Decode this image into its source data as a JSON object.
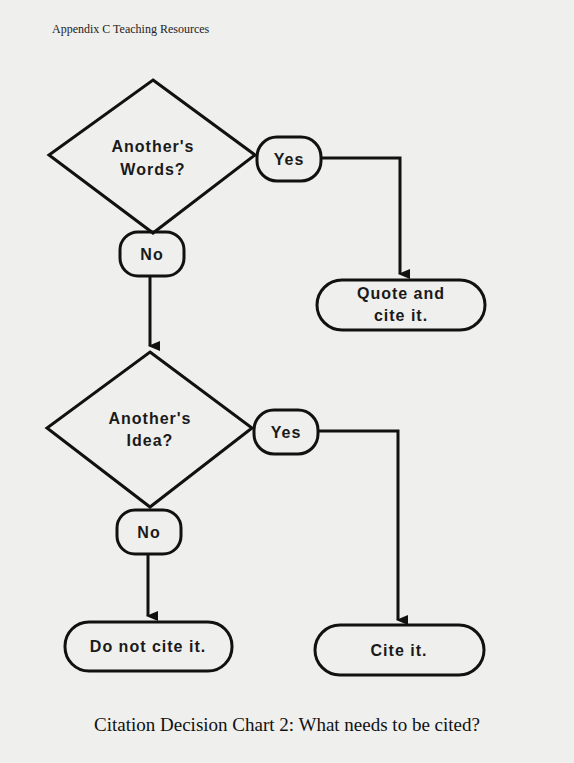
{
  "header": "Appendix C  Teaching Resources",
  "caption": "Citation Decision Chart 2: What needs to be cited?",
  "decisions": [
    {
      "line1": "Another's",
      "line2": "Words?"
    },
    {
      "line1": "Another's",
      "line2": "Idea?"
    }
  ],
  "branches": {
    "yes1": "Yes",
    "no1": "No",
    "yes2": "Yes",
    "no2": "No"
  },
  "outcomes": {
    "quote": {
      "line1": "Quote and",
      "line2": "cite it."
    },
    "cite": "Cite it.",
    "nocite": "Do not cite it."
  }
}
